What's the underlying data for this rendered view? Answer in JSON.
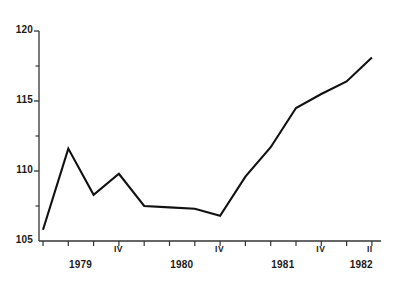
{
  "chart_data": {
    "type": "line",
    "title": "",
    "xlabel": "",
    "ylabel": "",
    "ylim": [
      105,
      120
    ],
    "grid": false,
    "legend": null,
    "y_ticks_major": [
      105,
      110,
      115,
      120
    ],
    "y_ticks_minor": [
      107.5,
      112.5,
      117.5
    ],
    "y_tick_labels": [
      "105",
      "110",
      "115",
      "120"
    ],
    "x_axis_note": "Quarterly series, 1979 Q1 through 1982 Q2",
    "x_group_labels": [
      "1979",
      "1980",
      "1981",
      "1982"
    ],
    "x_quarter_labels": [
      "IV",
      "IV",
      "IV",
      "II"
    ],
    "x": [
      "1979-I",
      "1979-II",
      "1979-III",
      "1979-IV",
      "1980-I",
      "1980-II",
      "1980-III",
      "1980-IV",
      "1981-I",
      "1981-II",
      "1981-III",
      "1981-IV",
      "1982-I",
      "1982-II"
    ],
    "values": [
      105.8,
      111.6,
      108.3,
      109.8,
      107.5,
      107.4,
      107.3,
      106.8,
      109.6,
      111.7,
      114.5,
      115.5,
      116.4,
      118.1
    ],
    "line_color": "#111111",
    "axis_color": "#333333",
    "background": "#ffffff"
  },
  "axis": {
    "y_labels": [
      "120",
      "115",
      "110",
      "105"
    ],
    "x_year_labels": [
      "1979",
      "1980",
      "1981",
      "1982"
    ],
    "x_quarter_marks": [
      "IV",
      "IV",
      "IV",
      "II"
    ]
  }
}
